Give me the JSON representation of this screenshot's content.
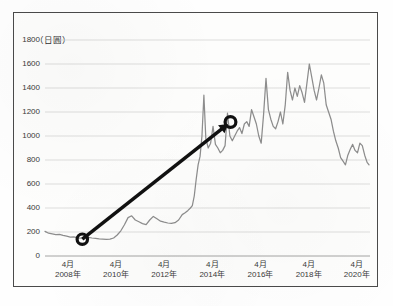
{
  "chart_data": {
    "type": "line",
    "title": "",
    "subtitle": "",
    "unit_label": "（日圓）",
    "ylabel": "",
    "xlabel": "",
    "ylim": [
      0,
      1800
    ],
    "ytick_values": [
      1800,
      1600,
      1400,
      1200,
      1000,
      800,
      600,
      400,
      200,
      0
    ],
    "ytick_labels": [
      "1800",
      "1600",
      "1400",
      "1200",
      "1000",
      "800",
      "600",
      "400",
      "200",
      "0"
    ],
    "grid": true,
    "grid_color": "#cfcfcf",
    "legend": "none",
    "xtick_labels": [
      {
        "month": "4月",
        "year": "2008年"
      },
      {
        "month": "4月",
        "year": "2010年"
      },
      {
        "month": "4月",
        "year": "2012年"
      },
      {
        "month": "4月",
        "year": "2014年"
      },
      {
        "month": "4月",
        "year": "2016年"
      },
      {
        "month": "4月",
        "year": "2018年"
      },
      {
        "month": "4月",
        "year": "2020年"
      }
    ],
    "xlim": [
      "2007年4月",
      "2020年10月"
    ],
    "series": [
      {
        "name": "股價",
        "color": "#8d8d8d",
        "x": [
          2007.3,
          2007.45,
          2007.6,
          2007.75,
          2007.9,
          2008.05,
          2008.2,
          2008.35,
          2008.5,
          2008.65,
          2008.8,
          2008.95,
          2009.1,
          2009.25,
          2009.4,
          2009.55,
          2009.7,
          2009.85,
          2010.0,
          2010.15,
          2010.3,
          2010.45,
          2010.6,
          2010.75,
          2010.9,
          2011.05,
          2011.2,
          2011.35,
          2011.5,
          2011.65,
          2011.8,
          2011.95,
          2012.1,
          2012.25,
          2012.4,
          2012.55,
          2012.7,
          2012.85,
          2013.0,
          2013.12,
          2013.24,
          2013.34,
          2013.42,
          2013.5,
          2013.58,
          2013.66,
          2013.74,
          2013.82,
          2013.9,
          2013.98,
          2014.08,
          2014.18,
          2014.28,
          2014.38,
          2014.48,
          2014.58,
          2014.68,
          2014.78,
          2014.88,
          2014.98,
          2015.08,
          2015.18,
          2015.28,
          2015.38,
          2015.48,
          2015.58,
          2015.68,
          2015.78,
          2015.88,
          2015.98,
          2016.08,
          2016.18,
          2016.28,
          2016.38,
          2016.48,
          2016.58,
          2016.68,
          2016.78,
          2016.88,
          2016.98,
          2017.08,
          2017.18,
          2017.28,
          2017.38,
          2017.48,
          2017.58,
          2017.68,
          2017.78,
          2017.88,
          2017.98,
          2018.08,
          2018.18,
          2018.28,
          2018.38,
          2018.48,
          2018.58,
          2018.68,
          2018.78,
          2018.88,
          2018.98,
          2019.08,
          2019.18,
          2019.28,
          2019.38,
          2019.48,
          2019.58,
          2019.68,
          2019.78,
          2019.88,
          2019.98,
          2020.08,
          2020.18,
          2020.28,
          2020.38,
          2020.48,
          2020.58,
          2020.68,
          2020.76
        ],
        "y": [
          205,
          190,
          185,
          178,
          180,
          172,
          165,
          158,
          160,
          152,
          148,
          150,
          155,
          150,
          146,
          142,
          140,
          138,
          140,
          150,
          175,
          210,
          260,
          320,
          335,
          300,
          285,
          270,
          262,
          300,
          330,
          310,
          290,
          282,
          275,
          272,
          278,
          300,
          345,
          360,
          380,
          400,
          420,
          500,
          640,
          760,
          830,
          1000,
          1340,
          980,
          900,
          940,
          1080,
          930,
          900,
          860,
          880,
          920,
          1190,
          1000,
          960,
          1000,
          1040,
          1070,
          1020,
          1100,
          1120,
          1080,
          1220,
          1160,
          1100,
          1000,
          940,
          1180,
          1480,
          1220,
          1140,
          1080,
          1060,
          1120,
          1200,
          1100,
          1260,
          1530,
          1380,
          1300,
          1400,
          1330,
          1420,
          1360,
          1280,
          1440,
          1600,
          1490,
          1380,
          1300,
          1400,
          1510,
          1440,
          1260,
          1200,
          1140,
          1040,
          960,
          900,
          820,
          790,
          760,
          840,
          890,
          930,
          880,
          860,
          940,
          920,
          840,
          780,
          760
        ]
      }
    ],
    "annotations": [
      {
        "type": "trend-arrow",
        "name": "growth-trend-arrow",
        "color": "#111111",
        "start": {
          "x": 2008.85,
          "y": 140
        },
        "end": {
          "x": 2014.9,
          "y": 1100
        },
        "start_marker": "open-circle",
        "end_marker": "open-circle",
        "arrowhead": true
      }
    ]
  }
}
